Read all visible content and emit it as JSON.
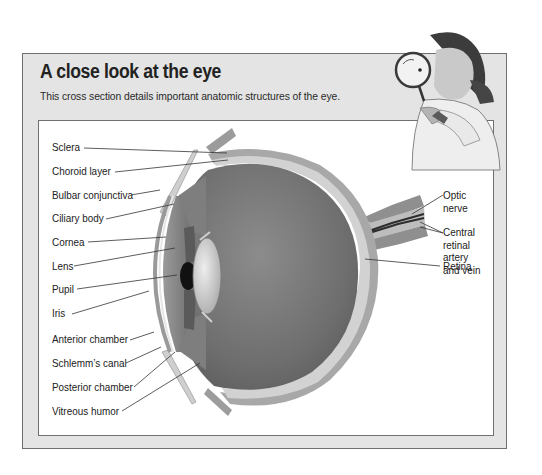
{
  "header": {
    "title": "A close look at the eye",
    "subtitle": "This cross section details important anatomic structures of the eye."
  },
  "diagram": {
    "left_labels": [
      {
        "text": "Sclera"
      },
      {
        "text": "Choroid layer"
      },
      {
        "text": "Bulbar conjunctiva"
      },
      {
        "text": "Ciliary body"
      },
      {
        "text": "Cornea"
      },
      {
        "text": "Lens"
      },
      {
        "text": "Pupil"
      },
      {
        "text": "Iris"
      },
      {
        "text": "Anterior chamber"
      },
      {
        "text": "Schlemm’s canal"
      },
      {
        "text": "Posterior chamber"
      },
      {
        "text": "Vitreous humor"
      }
    ],
    "right_labels": [
      {
        "lines": [
          "Optic",
          "nerve"
        ]
      },
      {
        "lines": [
          "Central",
          "retinal",
          "artery",
          "and vein"
        ]
      },
      {
        "lines": [
          "Retina"
        ]
      }
    ]
  },
  "illustration": {
    "description": "Woman looking through a magnifying glass",
    "icon": "magnifier-woman-illustration"
  },
  "colors": {
    "panel_bg": "#e4e4e4",
    "figure_bg": "#ffffff",
    "border": "#6f6f6f",
    "eye_interior": "#7a7a7a",
    "sclera": "#b5b5b5"
  }
}
